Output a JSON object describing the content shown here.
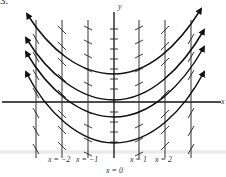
{
  "figure": {
    "problem_number": "3.",
    "axes": {
      "x_label": "x",
      "y_label": "y"
    },
    "isocline_labels": [
      {
        "text": "x = −2",
        "x": 62
      },
      {
        "text": "x = −1",
        "x": 88
      },
      {
        "text": "x = 1",
        "x": 139
      },
      {
        "text": "x = 2",
        "x": 165
      },
      {
        "text": "x = 0",
        "x": 114
      }
    ],
    "colors": {
      "ink": "#111111",
      "background": "#ffffff"
    }
  }
}
